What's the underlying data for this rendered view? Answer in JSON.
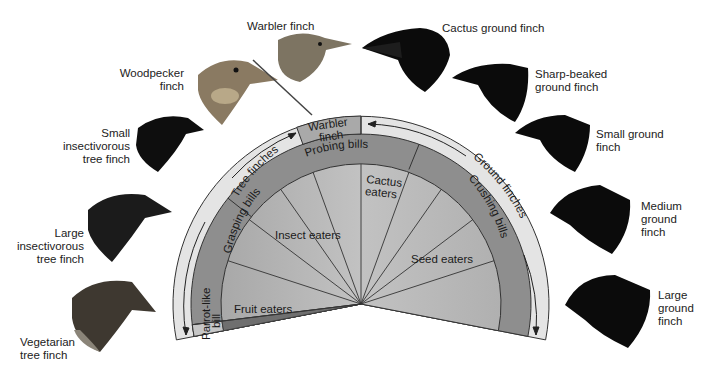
{
  "diagram": {
    "type": "fan_diagram",
    "center": [
      361,
      304
    ],
    "colors": {
      "outer_band": "#e4e4e4",
      "bills_band": "#8e8e8e",
      "wedge_light": "#b9b9b9",
      "fruit_wedge": "#7a7a7a",
      "warbler_box": "#a9a9a9",
      "parrot_box": "#c7c7c7",
      "outline": "#333333",
      "text": "#222222",
      "bird_dark": "#0d0d0d",
      "bird_brown": "#6e6355"
    },
    "groups": {
      "tree_finches": "Tree finches",
      "ground_finches": "Ground finches",
      "warbler_box": [
        "Warbler",
        "finch"
      ]
    },
    "bill_types": {
      "probing": "Probing bills",
      "grasping": "Grasping bills",
      "parrot": [
        "Parrot-like",
        "bill"
      ],
      "crushing": "Crushing bills"
    },
    "diets": {
      "insect": "Insect eaters",
      "cactus": [
        "Cactus",
        "eaters"
      ],
      "seed": "Seed eaters",
      "fruit": "Fruit eaters"
    }
  },
  "species": [
    {
      "id": "vegetarian",
      "label": [
        "Vegetarian",
        "tree finch"
      ]
    },
    {
      "id": "large-insectivorous",
      "label": [
        "Large",
        "insectivorous",
        "tree finch"
      ]
    },
    {
      "id": "small-insectivorous",
      "label": [
        "Small",
        "insectivorous",
        "tree finch"
      ]
    },
    {
      "id": "woodpecker",
      "label": [
        "Woodpecker",
        "finch"
      ]
    },
    {
      "id": "warbler",
      "label": [
        "Warbler finch"
      ]
    },
    {
      "id": "cactus-ground",
      "label": [
        "Cactus ground finch"
      ]
    },
    {
      "id": "sharp-beaked",
      "label": [
        "Sharp-beaked",
        "ground finch"
      ]
    },
    {
      "id": "small-ground",
      "label": [
        "Small ground",
        "finch"
      ]
    },
    {
      "id": "medium-ground",
      "label": [
        "Medium",
        "ground",
        "finch"
      ]
    },
    {
      "id": "large-ground",
      "label": [
        "Large",
        "ground",
        "finch"
      ]
    }
  ]
}
